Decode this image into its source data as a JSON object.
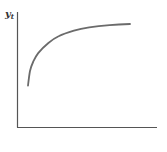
{
  "chart_data": {
    "type": "line",
    "title": "",
    "xlabel": "",
    "ylabel": "y",
    "ylabel_subscript": "t",
    "grid": false,
    "legend": null,
    "series": [
      {
        "name": "y_t",
        "color": "#6b6b6b",
        "points": [
          [
            0.0,
            0.37
          ],
          [
            0.02,
            0.5
          ],
          [
            0.05,
            0.58
          ],
          [
            0.1,
            0.66
          ],
          [
            0.2,
            0.75
          ],
          [
            0.3,
            0.81
          ],
          [
            0.45,
            0.86
          ],
          [
            0.6,
            0.89
          ],
          [
            0.8,
            0.91
          ],
          [
            1.0,
            0.92
          ]
        ]
      }
    ],
    "xlim": [
      0,
      1
    ],
    "ylim": [
      0,
      1
    ]
  },
  "colors": {
    "axis": "#555555",
    "curve": "#6b6b6b",
    "label": "#333333",
    "background": "#ffffff"
  }
}
